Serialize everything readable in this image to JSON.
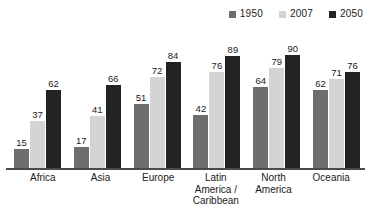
{
  "chart": {
    "legend_position": "top-right",
    "grid": false,
    "y_axis_visible": false,
    "x_axis_visible": true
  },
  "legend": {
    "entries": [
      {
        "label": "1950",
        "color": "#6e6e6e",
        "swatch_name": "legend-swatch-1950"
      },
      {
        "label": "2007",
        "color": "#d4d4d4",
        "swatch_name": "legend-swatch-2007"
      },
      {
        "label": "2050",
        "color": "#232323",
        "swatch_name": "legend-swatch-2050"
      }
    ]
  },
  "chart_data": {
    "type": "bar",
    "title": "",
    "xlabel": "",
    "ylabel": "",
    "ylim": [
      0,
      100
    ],
    "grid": false,
    "legend_position": "top-right",
    "categories": [
      "Africa",
      "Asia",
      "Europe",
      "Latin\nAmerica /\nCaribbean",
      "North\nAmerica",
      "Oceania"
    ],
    "series": [
      {
        "name": "1950",
        "color": "#6e6e6e",
        "values": [
          15,
          17,
          51,
          42,
          64,
          62
        ]
      },
      {
        "name": "2007",
        "color": "#d4d4d4",
        "values": [
          37,
          41,
          72,
          76,
          79,
          71
        ]
      },
      {
        "name": "2050",
        "color": "#232323",
        "values": [
          62,
          66,
          84,
          89,
          90,
          76
        ]
      }
    ]
  }
}
